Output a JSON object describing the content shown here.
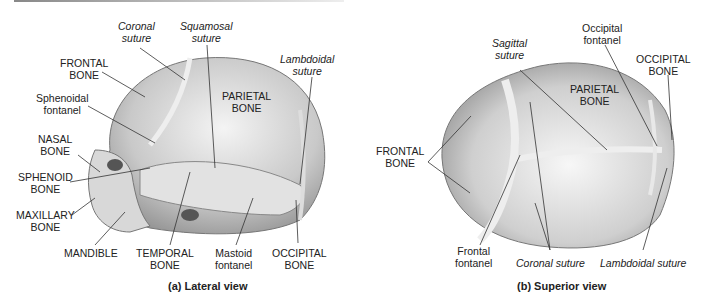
{
  "lateral": {
    "caption": "(a) Lateral view",
    "labels": {
      "coronal_suture": [
        "Coronal",
        "suture"
      ],
      "squamosal_suture": [
        "Squamosal",
        "suture"
      ],
      "frontal_bone": [
        "FRONTAL",
        "BONE"
      ],
      "lambdoidal_suture": [
        "Lambdoidal",
        "suture"
      ],
      "sphenoidal_fontanel": [
        "Sphenoidal",
        "fontanel"
      ],
      "parietal_bone": [
        "PARIETAL",
        "BONE"
      ],
      "nasal_bone": [
        "NASAL",
        "BONE"
      ],
      "sphenoid_bone": [
        "SPHENOID",
        "BONE"
      ],
      "maxillary_bone": [
        "MAXILLARY",
        "BONE"
      ],
      "mandible": "MANDIBLE",
      "temporal_bone": [
        "TEMPORAL",
        "BONE"
      ],
      "mastoid_fontanel": [
        "Mastoid",
        "fontanel"
      ],
      "occipital_bone": [
        "OCCIPITAL",
        "BONE"
      ]
    }
  },
  "superior": {
    "caption": "(b) Superior view",
    "labels": {
      "sagittal_suture": [
        "Sagittal",
        "suture"
      ],
      "occipital_fontanel": [
        "Occipital",
        "fontanel"
      ],
      "occipital_bone": [
        "OCCIPITAL",
        "BONE"
      ],
      "parietal_bone": [
        "PARIETAL",
        "BONE"
      ],
      "frontal_bone": [
        "FRONTAL",
        "BONE"
      ],
      "frontal_fontanel": [
        "Frontal",
        "fontanel"
      ],
      "coronal_suture": "Coronal suture",
      "lambdoidal_suture": "Lambdoidal suture"
    }
  }
}
